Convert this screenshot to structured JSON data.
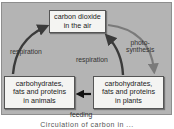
{
  "diagram": {
    "nodes": {
      "air": "carbon dioxide\nin the air",
      "animals": "carbohydrates,\nfats and proteins\nin animals",
      "plants": "carbohydrates,\nfats and proteins\nin plants"
    },
    "edges": [
      {
        "from": "animals",
        "to": "air",
        "label": "respiration"
      },
      {
        "from": "plants",
        "to": "air",
        "label": "respiration"
      },
      {
        "from": "air",
        "to": "plants",
        "label": "photo-\nsynthesis"
      },
      {
        "from": "plants",
        "to": "animals",
        "label": "feeding"
      }
    ],
    "labels": {
      "respiration_left": "respiration",
      "respiration_mid": "respiration",
      "photosynthesis": "photo-\nsynthesis",
      "feeding": "feeding"
    },
    "caption": "Circulation of carbon in ...",
    "colors": {
      "panel": "#b4b4b4",
      "box": "#f4f4f2",
      "respiration_arrow": "#3a3a3a",
      "photosynthesis_arrow": "#7a7a7a",
      "feeding_arrow": "#111111"
    }
  }
}
